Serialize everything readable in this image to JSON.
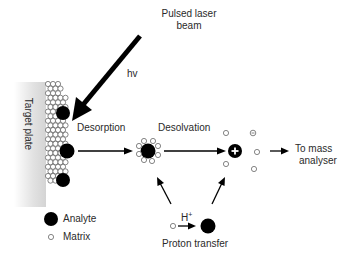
{
  "diagram": {
    "labels": {
      "laser_line1": "Pulsed laser",
      "laser_line2": "beam",
      "hv": "hv",
      "target_plate": "Target plate",
      "desorption": "Desorption",
      "desolvation": "Desolvation",
      "to_mass_line1": "To mass",
      "to_mass_line2": "analyser",
      "h_plus": "H",
      "h_plus_sup": "+",
      "proton_transfer": "Proton transfer",
      "plus_sign": "+",
      "minus_sign": "−"
    },
    "legend": [
      {
        "symbol": "filled-circle",
        "label": "Analyte"
      },
      {
        "symbol": "open-circle",
        "label": "Matrix"
      }
    ],
    "colors": {
      "ink": "#000000",
      "text": "#2a2a2a",
      "plate_shade": "#d9d9d9",
      "matrix_stroke": "#555555"
    }
  }
}
